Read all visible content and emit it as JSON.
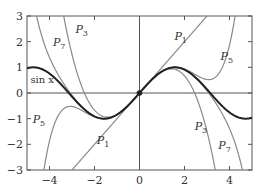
{
  "chart_data": {
    "type": "line",
    "title": "",
    "xlabel": "",
    "ylabel": "",
    "xlim": [
      -5,
      5
    ],
    "ylim": [
      -3,
      3
    ],
    "xticks": [
      -4,
      -2,
      0,
      2,
      4
    ],
    "yticks": [
      -3,
      -2,
      -1,
      0,
      1,
      2,
      3
    ],
    "grid": false,
    "legend": "inline labels",
    "series": [
      {
        "name": "sin x",
        "label": "sin x",
        "function": "sin(x)",
        "color": "#222222",
        "width": 2
      },
      {
        "name": "P1",
        "label": "P",
        "sub": "1",
        "function": "x",
        "color": "#8a8a8a",
        "width": 1.2
      },
      {
        "name": "P3",
        "label": "P",
        "sub": "3",
        "function": "x - x^3/6",
        "color": "#8a8a8a",
        "width": 1.2
      },
      {
        "name": "P5",
        "label": "P",
        "sub": "5",
        "function": "x - x^3/6 + x^5/120",
        "color": "#8a8a8a",
        "width": 1.2
      },
      {
        "name": "P7",
        "label": "P",
        "sub": "7",
        "function": "x - x^3/6 + x^5/120 - x^7/5040",
        "color": "#8a8a8a",
        "width": 1.2
      }
    ],
    "annotations": [
      {
        "text": "P7",
        "x": -3.85,
        "y": 1.85
      },
      {
        "text": "P3",
        "x": -2.85,
        "y": 2.35
      },
      {
        "text": "P1",
        "x": 1.55,
        "y": 2.05
      },
      {
        "text": "P5",
        "x": 3.6,
        "y": 1.3
      },
      {
        "text": "sin x",
        "x": -4.85,
        "y": 0.4
      },
      {
        "text": "P5",
        "x": -4.75,
        "y": -1.15
      },
      {
        "text": "P1",
        "x": -1.9,
        "y": -2.0
      },
      {
        "text": "P3",
        "x": 2.45,
        "y": -1.45
      },
      {
        "text": "P7",
        "x": 3.5,
        "y": -2.2
      }
    ],
    "points": [
      {
        "x": 0,
        "y": 0,
        "marker": "dot"
      }
    ]
  }
}
